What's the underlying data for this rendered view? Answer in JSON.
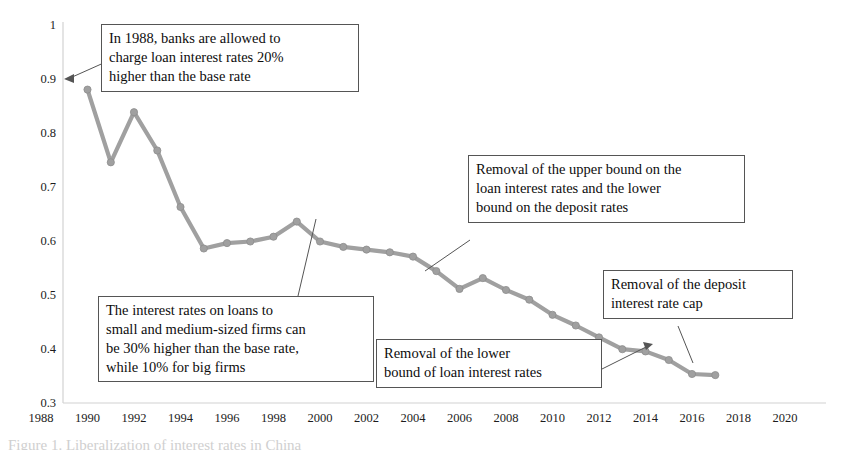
{
  "chart_data": {
    "type": "line",
    "title": "",
    "xlabel": "",
    "ylabel": "",
    "xlim": [
      1988,
      2020
    ],
    "ylim": [
      0.3,
      1.0
    ],
    "grid": false,
    "legend": "none",
    "xticks": [
      "1988",
      "1990",
      "1992",
      "1994",
      "1996",
      "1998",
      "2000",
      "2002",
      "2004",
      "2006",
      "2008",
      "2010",
      "2012",
      "2014",
      "2016",
      "2018",
      "2020"
    ],
    "yticks": [
      "1",
      "0.9",
      "0.8",
      "0.7",
      "0.6",
      "0.5",
      "0.4"
    ],
    "ytick_bottom": "0.3",
    "series": [
      {
        "name": "ratio",
        "color": "#a0a0a0",
        "marker": "circle",
        "x": [
          1990,
          1991,
          1992,
          1993,
          1994,
          1995,
          1996,
          1997,
          1998,
          1999,
          2000,
          2001,
          2002,
          2003,
          2004,
          2005,
          2006,
          2007,
          2008,
          2009,
          2010,
          2011,
          2012,
          2013,
          2014,
          2015,
          2016,
          2017
        ],
        "values": [
          0.88,
          0.745,
          0.838,
          0.767,
          0.662,
          0.585,
          0.595,
          0.598,
          0.607,
          0.635,
          0.598,
          0.588,
          0.583,
          0.578,
          0.57,
          0.543,
          0.51,
          0.53,
          0.508,
          0.49,
          0.462,
          0.442,
          0.42,
          0.398,
          0.394,
          0.378,
          0.352,
          0.35
        ]
      }
    ],
    "annotations": [
      {
        "id": "annotation-1988-loan-rate-markup",
        "lines": [
          "In 1988, banks are allowed to",
          "charge loan interest rates 20%",
          "higher than the base rate"
        ],
        "target_value": 0.9
      },
      {
        "id": "annotation-sme-loan-rate-markup",
        "lines": [
          "The interest rates on loans to",
          "small and medium-sized firms can",
          "be 30% higher than the base rate,",
          "while 10% for big firms"
        ],
        "target_year": 1999
      },
      {
        "id": "annotation-removal-upper-bound",
        "lines": [
          "Removal of the upper bound on the",
          "loan interest rates and the lower",
          "bound on the deposit rates"
        ],
        "target_year": 2004
      },
      {
        "id": "annotation-removal-lower-bound",
        "lines": [
          "Removal of the lower",
          "bound of loan interest rates"
        ],
        "target_year": 2013
      },
      {
        "id": "annotation-removal-deposit-cap",
        "lines": [
          "Removal of the deposit",
          "interest rate cap"
        ],
        "target_year": 2015
      }
    ]
  },
  "caption": {
    "text": "Figure 1. Liberalization of interest rates in China"
  }
}
